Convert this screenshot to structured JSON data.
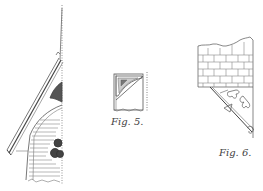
{
  "figures": [
    {
      "id": "fig-4-partial",
      "label": "",
      "description": "Roof eave bracket section with slanted rafter, trefoil cutouts and horizontal hatching"
    },
    {
      "id": "fig-5",
      "label": "Fig. 5.",
      "description": "Small corner bracket elevation with dotted vertical edge"
    },
    {
      "id": "fig-6",
      "label": "Fig. 6.",
      "description": "Brick wall with diagonal bracket and trefoil fretwork"
    }
  ],
  "colors": {
    "ink": "#555555",
    "ink_dark": "#333333",
    "paper": "#ffffff"
  }
}
